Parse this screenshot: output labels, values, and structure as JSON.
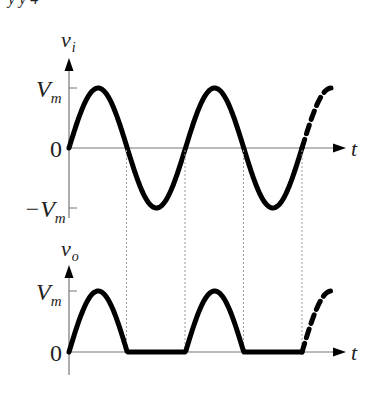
{
  "top_clip_text": "y   y   4",
  "input_plot": {
    "ylabel": "v",
    "ylabel_sub": "i",
    "xlabel": "t",
    "ticks": {
      "vm": "V",
      "vm_sub": "m",
      "zero": "0",
      "neg": "−V",
      "neg_sub": "m"
    }
  },
  "output_plot": {
    "ylabel": "v",
    "ylabel_sub": "o",
    "xlabel": "t",
    "ticks": {
      "vm": "V",
      "vm_sub": "m",
      "zero": "0"
    }
  },
  "colors": {
    "curve": "#000000",
    "axis": "#777777",
    "guide": "#999999"
  }
}
